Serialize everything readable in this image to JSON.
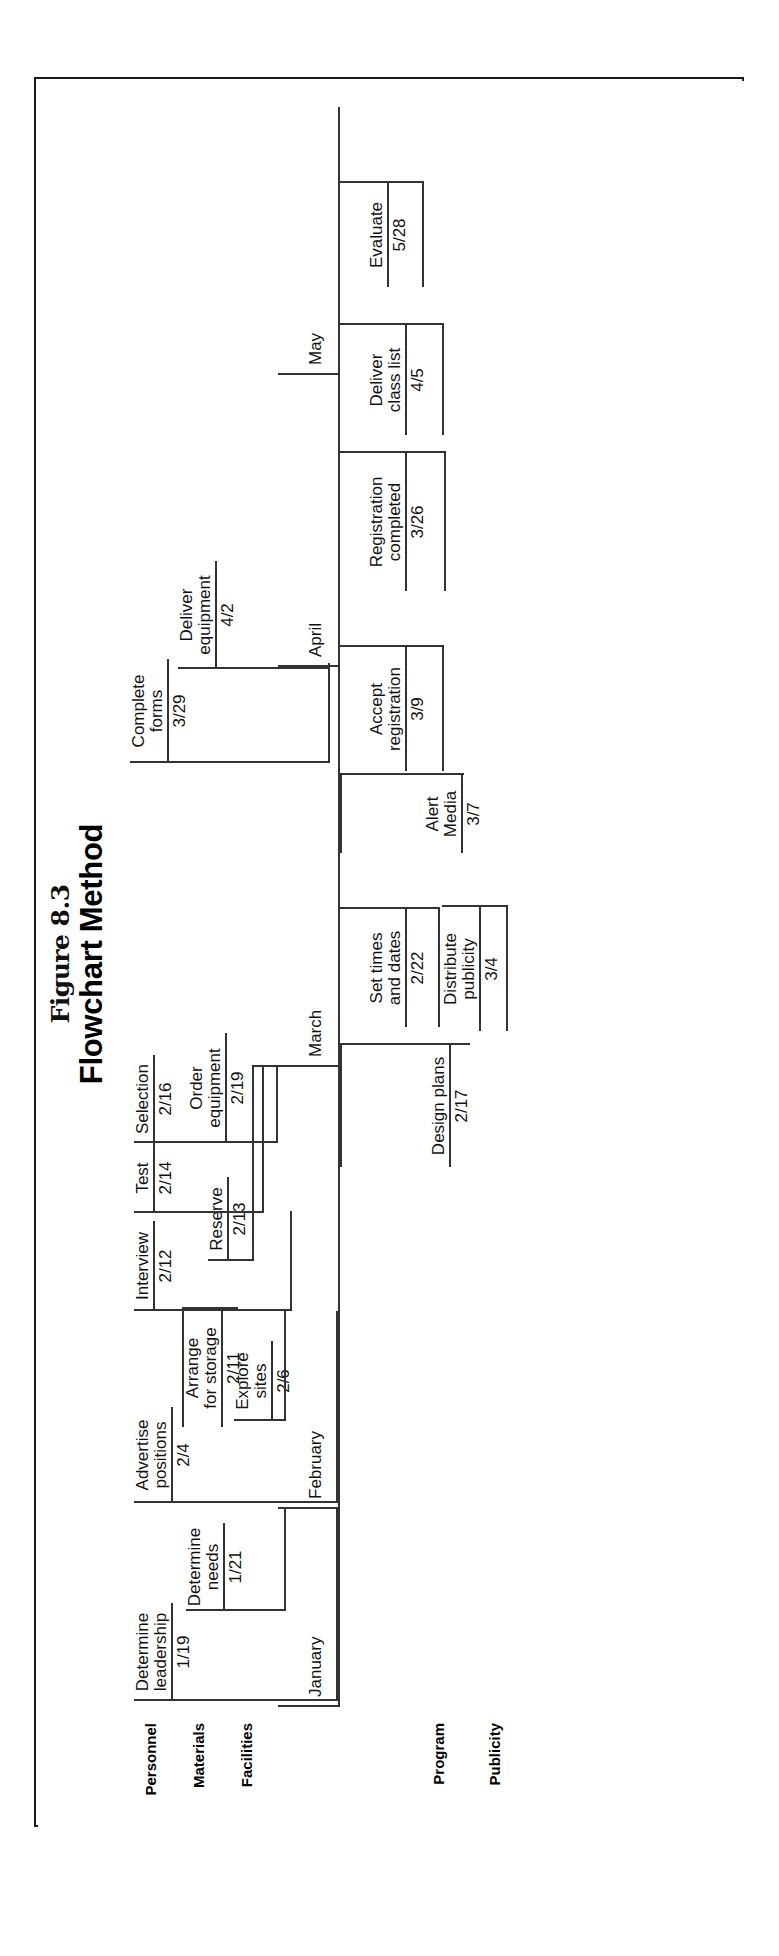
{
  "figure": {
    "number": "Figure 8.3",
    "title": "Flowchart Method"
  },
  "rows": [
    {
      "id": "personnel",
      "label": "Personnel"
    },
    {
      "id": "materials",
      "label": "Materials"
    },
    {
      "id": "facilities",
      "label": "Facilities"
    },
    {
      "id": "program",
      "label": "Program"
    },
    {
      "id": "publicity",
      "label": "Publicity"
    }
  ],
  "months": [
    {
      "id": "january",
      "label": "January"
    },
    {
      "id": "february",
      "label": "February"
    },
    {
      "id": "march",
      "label": "March"
    },
    {
      "id": "april",
      "label": "April"
    },
    {
      "id": "may",
      "label": "May"
    }
  ],
  "tasks": [
    {
      "id": "determine-leadership",
      "row": "personnel",
      "line1": "Determine",
      "line2": "leadership",
      "date": "1/19"
    },
    {
      "id": "determine-needs",
      "row": "materials",
      "line1": "Determine",
      "line2": "needs",
      "date": "1/21"
    },
    {
      "id": "advertise-positions",
      "row": "personnel",
      "line1": "Advertise",
      "line2": "positions",
      "date": "2/4"
    },
    {
      "id": "explore-sites",
      "row": "facilities",
      "line1": "Explore",
      "line2": "sites",
      "date": "2/6"
    },
    {
      "id": "arrange-for-storage",
      "row": "materials",
      "line1": "Arrange",
      "line2": "for storage",
      "date": "2/11"
    },
    {
      "id": "interview",
      "row": "personnel",
      "line1": "Interview",
      "line2": "",
      "date": "2/12"
    },
    {
      "id": "reserve",
      "row": "facilities",
      "line1": "Reserve",
      "line2": "",
      "date": "2/13"
    },
    {
      "id": "test",
      "row": "personnel",
      "line1": "Test",
      "line2": "",
      "date": "2/14"
    },
    {
      "id": "selection",
      "row": "personnel",
      "line1": "Selection",
      "line2": "",
      "date": "2/16"
    },
    {
      "id": "design-plans",
      "row": "publicity",
      "line1": "Design plans",
      "line2": "",
      "date": "2/17"
    },
    {
      "id": "order-equipment",
      "row": "materials",
      "line1": "Order",
      "line2": "equipment",
      "date": "2/19"
    },
    {
      "id": "set-times-and-dates",
      "row": "program",
      "line1": "Set times",
      "line2": "and dates",
      "date": "2/22"
    },
    {
      "id": "distribute-publicity",
      "row": "publicity",
      "line1": "Distribute",
      "line2": "publicity",
      "date": "3/4"
    },
    {
      "id": "alert-media",
      "row": "publicity",
      "line1": "Alert",
      "line2": "Media",
      "date": "3/7"
    },
    {
      "id": "accept-registration",
      "row": "program",
      "line1": "Accept",
      "line2": "registration",
      "date": "3/9"
    },
    {
      "id": "registration-completed",
      "row": "program",
      "line1": "Registration",
      "line2": "completed",
      "date": "3/26"
    },
    {
      "id": "complete-forms",
      "row": "personnel",
      "line1": "Complete",
      "line2": "forms",
      "date": "3/29"
    },
    {
      "id": "deliver-equipment",
      "row": "materials",
      "line1": "Deliver",
      "line2": "equipment",
      "date": "4/2"
    },
    {
      "id": "deliver-class-list",
      "row": "program",
      "line1": "Deliver",
      "line2": "class list",
      "date": "4/5"
    },
    {
      "id": "evaluate",
      "row": "program",
      "line1": "Evaluate",
      "line2": "",
      "date": "5/28"
    }
  ]
}
